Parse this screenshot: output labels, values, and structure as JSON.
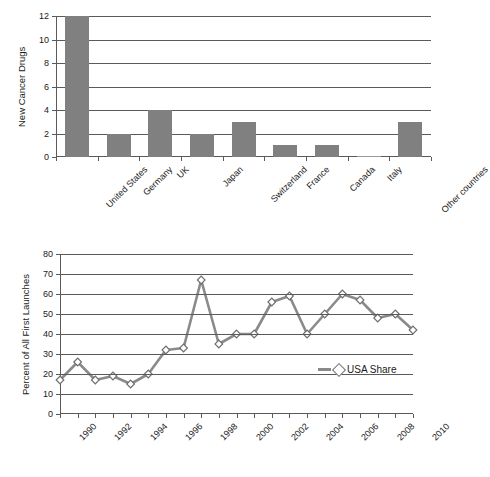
{
  "chart_data": [
    {
      "type": "bar",
      "title": "",
      "xlabel": "",
      "ylabel": "New Cancer Drugs",
      "categories": [
        "United States",
        "Germany",
        "UK",
        "Japan",
        "Switzerland",
        "France",
        "Canada",
        "Italy",
        "Other countries"
      ],
      "values": [
        12,
        2,
        4,
        2,
        3,
        1,
        1,
        0,
        3
      ],
      "ylim": [
        0,
        12
      ],
      "yticks": [
        0,
        2,
        4,
        6,
        8,
        10,
        12
      ],
      "grid": true,
      "legend": "none",
      "bar_color": "#808080"
    },
    {
      "type": "line",
      "title": "",
      "xlabel": "",
      "ylabel": "Percent of All First Launches",
      "x": [
        1990,
        1991,
        1992,
        1993,
        1994,
        1995,
        1996,
        1997,
        1998,
        1999,
        2000,
        2001,
        2002,
        2003,
        2004,
        2005,
        2006,
        2007,
        2008,
        2009,
        2010
      ],
      "xtick_labels": [
        "1990",
        "1992",
        "1994",
        "1996",
        "1998",
        "2000",
        "2002",
        "2004",
        "2006",
        "2008",
        "2010"
      ],
      "series": [
        {
          "name": "USA Share",
          "values": [
            17,
            26,
            17,
            19,
            15,
            20,
            32,
            33,
            67,
            35,
            40,
            40,
            56,
            59,
            40,
            50,
            60,
            57,
            48,
            50,
            42
          ]
        }
      ],
      "ylim": [
        0,
        80
      ],
      "yticks": [
        0,
        10,
        20,
        30,
        40,
        50,
        60,
        70,
        80
      ],
      "grid": true,
      "legend": "USA Share",
      "legend_position": "inside-right",
      "line_color": "#8a8a8a",
      "marker": "diamond",
      "marker_fill": "#ffffff",
      "marker_edge": "#6f6f6f"
    }
  ]
}
